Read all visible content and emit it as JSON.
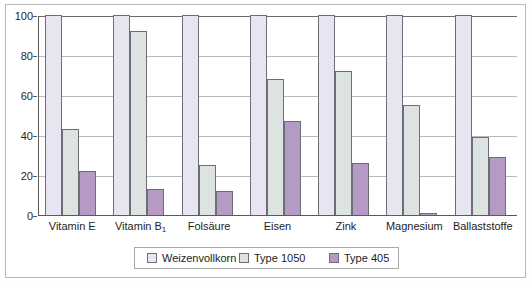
{
  "chart_data": {
    "type": "bar",
    "title": "",
    "subtitle": "",
    "xlabel": "",
    "ylabel": "",
    "ylim": [
      0,
      100
    ],
    "yticks": [
      0,
      20,
      40,
      60,
      80,
      100
    ],
    "ytick_labels": [
      "0",
      "20",
      "40",
      "60",
      "80",
      "100"
    ],
    "grid": true,
    "grid_axis": "y",
    "legend_position": "bottom-center",
    "categories": [
      "Vitamin E",
      "Vitamin B₁",
      "Folsäure",
      "Eisen",
      "Zink",
      "Magnesium",
      "Ballaststoffe"
    ],
    "category_labels_html": [
      "Vitamin E",
      "Vitamin B<sub>1</sub>",
      "Folsäure",
      "Eisen",
      "Zink",
      "Magnesium",
      "Ballaststoffe"
    ],
    "series": [
      {
        "name": "Weizenvollkorn",
        "color": "#e7e5f1",
        "values": [
          100,
          100,
          100,
          100,
          100,
          100,
          100
        ]
      },
      {
        "name": "Type 1050",
        "color": "#dde3e1",
        "values": [
          43,
          92,
          25,
          68,
          72,
          55,
          39
        ]
      },
      {
        "name": "Type 405",
        "color": "#b49ac4",
        "values": [
          22,
          13,
          12,
          47,
          26,
          1,
          29
        ]
      }
    ]
  },
  "legend": {
    "items": [
      {
        "label": "Weizenvollkorn",
        "swatch": "s0"
      },
      {
        "label": "Type 1050",
        "swatch": "s1"
      },
      {
        "label": "Type 405",
        "swatch": "s2"
      }
    ]
  },
  "colors": {
    "series_weizenvollkorn": "#e7e5f1",
    "series_type1050": "#dde3e1",
    "series_type405": "#b49ac4",
    "bar_outline": "#6d6d79",
    "axis": "#5a5a5a",
    "gridline": "#b9b9b9",
    "frame": "#b8b8b8",
    "text": "#1d1d1d",
    "background": "#ffffff"
  }
}
